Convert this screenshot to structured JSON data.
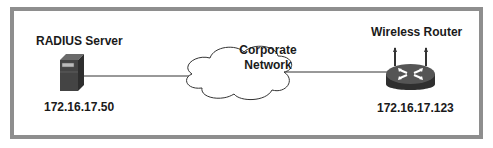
{
  "diagram": {
    "nodes": [
      {
        "id": "radius-server",
        "type": "server",
        "title": "RADIUS Server",
        "address": "172.16.17.50"
      },
      {
        "id": "corporate-network",
        "type": "cloud",
        "label_line1": "Corporate",
        "label_line2": "Network"
      },
      {
        "id": "wireless-router",
        "type": "router",
        "title": "Wireless Router",
        "address": "172.16.17.123"
      }
    ],
    "edges": [
      {
        "from": "radius-server",
        "to": "corporate-network"
      },
      {
        "from": "corporate-network",
        "to": "wireless-router"
      }
    ],
    "colors": {
      "frame_border": "#8e8e8e",
      "icon_dark": "#3a3a3a",
      "line": "#333333",
      "text": "#1a1a1a"
    }
  }
}
